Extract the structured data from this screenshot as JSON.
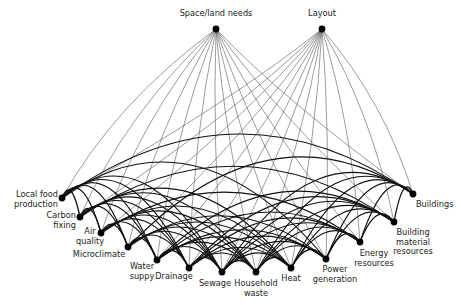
{
  "diagram": {
    "type": "network",
    "edge_colors": {
      "top_links": "#4a4a4a",
      "bottom_links": "#111111",
      "node": "#000000"
    },
    "top_nodes": [
      {
        "id": "space",
        "label": "Space/land needs",
        "x": 216,
        "y": 29,
        "lx": 216,
        "ly": 9,
        "align": "c"
      },
      {
        "id": "layout",
        "label": "Layout",
        "x": 322,
        "y": 29,
        "lx": 322,
        "ly": 9,
        "align": "c"
      }
    ],
    "bottom_nodes": [
      {
        "id": "food",
        "label": "Local food\nproduction",
        "x": 62,
        "y": 198,
        "lx": 58,
        "ly": 190,
        "align": "r"
      },
      {
        "id": "carbon",
        "label": "Carbon\nfixing",
        "x": 80,
        "y": 217,
        "lx": 76,
        "ly": 211,
        "align": "r"
      },
      {
        "id": "air",
        "label": "Air\nquality",
        "x": 101,
        "y": 233,
        "lx": 90,
        "ly": 227,
        "align": "c"
      },
      {
        "id": "micro",
        "label": "Microclimate",
        "x": 128,
        "y": 247,
        "lx": 99,
        "ly": 250,
        "align": "c"
      },
      {
        "id": "water",
        "label": "Water\nsuppy",
        "x": 157,
        "y": 260,
        "lx": 142,
        "ly": 262,
        "align": "c"
      },
      {
        "id": "drain",
        "label": "Drainage",
        "x": 189,
        "y": 268,
        "lx": 174,
        "ly": 272,
        "align": "c"
      },
      {
        "id": "sewage",
        "label": "Sewage",
        "x": 222,
        "y": 272,
        "lx": 215,
        "ly": 279,
        "align": "c"
      },
      {
        "id": "waste",
        "label": "Household\nwaste",
        "x": 256,
        "y": 272,
        "lx": 256,
        "ly": 279,
        "align": "c"
      },
      {
        "id": "heat",
        "label": "Heat",
        "x": 291,
        "y": 268,
        "lx": 291,
        "ly": 274,
        "align": "c"
      },
      {
        "id": "power",
        "label": "Power\ngeneration",
        "x": 326,
        "y": 259,
        "lx": 335,
        "ly": 265,
        "align": "c"
      },
      {
        "id": "energy",
        "label": "Energy\nresources",
        "x": 360,
        "y": 242,
        "lx": 374,
        "ly": 249,
        "align": "c"
      },
      {
        "id": "material",
        "label": "Building\nmaterial\nresources",
        "x": 394,
        "y": 222,
        "lx": 413,
        "ly": 228,
        "align": "c"
      },
      {
        "id": "buildings",
        "label": "Buildings",
        "x": 413,
        "y": 194,
        "lx": 416,
        "ly": 200,
        "align": "l"
      }
    ],
    "edges": {
      "top_to_bottom": "each top node connects to every bottom node (thin curved lines)",
      "bottom_to_bottom": "bottom nodes are densely interconnected with thick curved arcs"
    }
  }
}
